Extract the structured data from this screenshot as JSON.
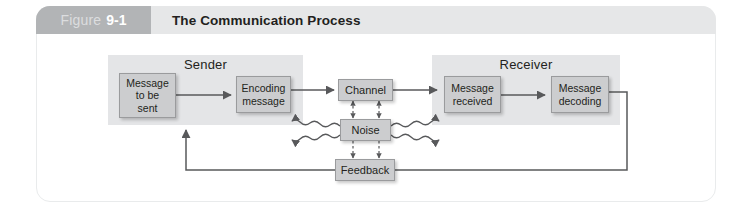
{
  "figure": {
    "tab_word": "Figure",
    "tab_number": "9-1",
    "title": "The Communication Process"
  },
  "diagram": {
    "groups": [
      {
        "key": "sender",
        "label": "Sender"
      },
      {
        "key": "receiver",
        "label": "Receiver"
      }
    ],
    "nodes": {
      "message_to_be_sent": "Message\nto be\nsent",
      "encoding_message": "Encoding\nmessage",
      "channel": "Channel",
      "message_received": "Message\nreceived",
      "message_decoding": "Message\ndecoding",
      "noise": "Noise",
      "feedback": "Feedback"
    }
  },
  "colors": {
    "header_band": "#e6e7e8",
    "tab": "#b2b4b6",
    "group_fill": "#e4e5e7",
    "node_fill": "#cccdcf",
    "node_border": "#9a9b9d",
    "line": "#58595b",
    "text": "#231f20",
    "card_border": "#e9ebec"
  }
}
